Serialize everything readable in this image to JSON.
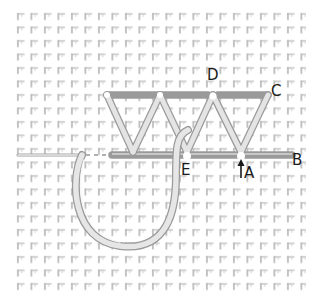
{
  "diagram": {
    "type": "embroidery-stitch-diagram",
    "fabric": {
      "grid_pitch_px": 13.5,
      "area": {
        "x": 14,
        "y": 8,
        "w": 292,
        "h": 284
      },
      "colors": {
        "background": "#ffffff",
        "weave": "#c9c9c9",
        "weave_dark": "#a8a8a8"
      }
    },
    "thread": {
      "color_fill": "#e6e6e6",
      "color_edge": "#9a9a9a"
    },
    "points": {
      "A": {
        "label": "A",
        "x": 241,
        "y": 155
      },
      "B": {
        "label": "B",
        "x": 292,
        "y": 155
      },
      "C": {
        "label": "C",
        "x": 268,
        "y": 95
      },
      "D": {
        "label": "D",
        "x": 213,
        "y": 95
      },
      "E": {
        "label": "E",
        "x": 187,
        "y": 155
      }
    },
    "labels": [
      {
        "id": "D",
        "text": "D",
        "x": 207,
        "y": 68
      },
      {
        "id": "C",
        "text": "C",
        "x": 271,
        "y": 84
      },
      {
        "id": "E",
        "text": "E",
        "x": 181,
        "y": 163
      },
      {
        "id": "A",
        "text": "A",
        "x": 244,
        "y": 166
      },
      {
        "id": "B",
        "text": "B",
        "x": 292,
        "y": 153
      }
    ],
    "arrow": {
      "at": "A",
      "direction": "up",
      "x": 241,
      "y1": 178,
      "y2": 160
    }
  }
}
